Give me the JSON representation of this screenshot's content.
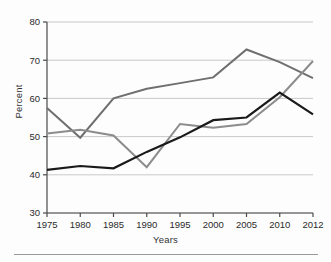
{
  "figure": {
    "background": "#fdfdfd",
    "plot": {
      "left": 47,
      "right": 313,
      "top": 22,
      "bottom": 213
    }
  },
  "axes": {
    "ylabel": "Percent",
    "xlabel": "Years"
  },
  "chart_data": {
    "type": "line",
    "title": "",
    "xlabel": "Years",
    "ylabel": "Percent",
    "x": [
      1975,
      1980,
      1985,
      1990,
      1995,
      2000,
      2005,
      2010,
      2012
    ],
    "categories": [
      "1975",
      "1980",
      "1985",
      "1990",
      "1995",
      "2000",
      "2005",
      "2010",
      "2012"
    ],
    "xticklabels": [
      "1975",
      "1980",
      "1985",
      "1990",
      "1995",
      "2000",
      "2005",
      "2010",
      "2012"
    ],
    "yticks": [
      30,
      40,
      50,
      60,
      70,
      80
    ],
    "yticklabels": [
      "30",
      "40",
      "50",
      "60",
      "70",
      "80"
    ],
    "ylim": [
      30,
      80
    ],
    "xlim": [
      1975,
      2012
    ],
    "grid": "horizontal",
    "grid_color": "#c9c9c9",
    "legend": "none",
    "series": [
      {
        "name": "series-1",
        "color": "#6f6f6f",
        "width": 2.0,
        "values": [
          57.5,
          49.7,
          60.0,
          62.5,
          64.0,
          65.5,
          72.8,
          69.5,
          65.3
        ]
      },
      {
        "name": "series-2",
        "color": "#8c8c8c",
        "width": 2.0,
        "values": [
          50.8,
          51.8,
          50.3,
          42.0,
          53.3,
          52.3,
          53.3,
          60.3,
          69.8
        ]
      },
      {
        "name": "series-3",
        "color": "#1a1a1a",
        "width": 2.2,
        "values": [
          41.3,
          42.3,
          41.7,
          46.0,
          49.8,
          54.3,
          55.0,
          61.5,
          55.8
        ]
      }
    ]
  }
}
